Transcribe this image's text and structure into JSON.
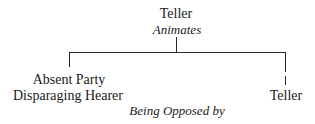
{
  "diagram": {
    "root": {
      "label": "Teller",
      "relation": "Animates"
    },
    "left_child": {
      "lines": [
        "Absent Party",
        "Disparaging Hearer"
      ]
    },
    "right_child": {
      "label": "Teller"
    },
    "bottom_relation": "Being Opposed by"
  }
}
